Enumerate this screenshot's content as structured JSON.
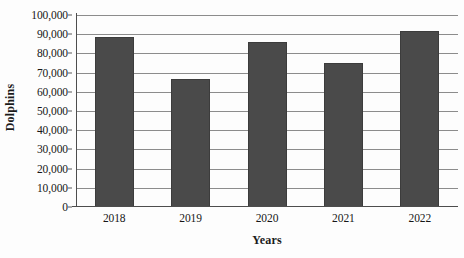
{
  "chart_data": {
    "type": "bar",
    "title": "",
    "subtitle": "",
    "xlabel": "Years",
    "ylabel": "Dolphins",
    "categories": [
      "2018",
      "2019",
      "2020",
      "2021",
      "2022"
    ],
    "values": [
      88500,
      66500,
      86000,
      75000,
      91500
    ],
    "ylim": [
      0,
      100000
    ],
    "ytick_values": [
      0,
      10000,
      20000,
      30000,
      40000,
      50000,
      60000,
      70000,
      80000,
      90000,
      100000
    ],
    "ytick_labels": [
      "0",
      "10,000",
      "20,000",
      "30,000",
      "40,000",
      "50,000",
      "60,000",
      "70,000",
      "80,000",
      "90,000",
      "100,000"
    ],
    "grid": true,
    "grid_axis": "y",
    "legend": false,
    "legend_position": "none",
    "series": [
      {
        "name": "Dolphins",
        "values": [
          88500,
          66500,
          86000,
          75000,
          91500
        ]
      }
    ],
    "bar_color": "#4a4a4a",
    "gridline_color": "#8c8c8c",
    "axis_color": "#4d4d4d",
    "background_color": "#fdfdfd",
    "annotations": []
  }
}
